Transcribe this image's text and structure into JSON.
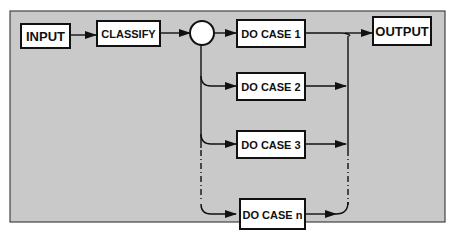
{
  "diagram": {
    "background": "#c9c9c9",
    "nodes": {
      "input": "INPUT",
      "classify": "CLASSIFY",
      "case1": "DO CASE 1",
      "case2": "DO CASE 2",
      "case3": "DO CASE 3",
      "casen": "DO CASE n",
      "output": "OUTPUT"
    },
    "decision_node": "circle"
  }
}
